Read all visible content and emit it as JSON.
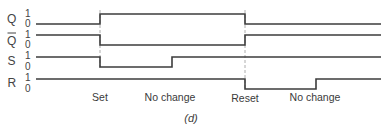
{
  "diagram": {
    "type": "timing-diagram",
    "caption": "(d)",
    "signals": [
      {
        "name": "Q",
        "overbar": false,
        "high_label": "1",
        "low_label": "0",
        "levels": [
          0,
          1,
          0
        ]
      },
      {
        "name": "Q",
        "overbar": true,
        "high_label": "1",
        "low_label": "0",
        "levels": [
          1,
          0,
          1
        ]
      },
      {
        "name": "S",
        "overbar": false,
        "high_label": "1",
        "low_label": "0",
        "levels": [
          1,
          0,
          1,
          1
        ]
      },
      {
        "name": "R",
        "overbar": false,
        "high_label": "1",
        "low_label": "0",
        "levels": [
          1,
          1,
          0,
          1
        ]
      }
    ],
    "events": [
      {
        "label": "Set"
      },
      {
        "label": "No change"
      },
      {
        "label": "Reset"
      },
      {
        "label": "No change"
      }
    ]
  }
}
